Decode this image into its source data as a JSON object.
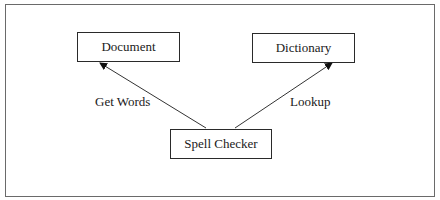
{
  "diagram": {
    "nodes": [
      {
        "id": "document",
        "label": "Document"
      },
      {
        "id": "dictionary",
        "label": "Dictionary"
      },
      {
        "id": "spell_checker",
        "label": "Spell Checker"
      }
    ],
    "edges": [
      {
        "from": "spell_checker",
        "to": "document",
        "label": "Get Words"
      },
      {
        "from": "spell_checker",
        "to": "dictionary",
        "label": "Lookup"
      }
    ]
  }
}
